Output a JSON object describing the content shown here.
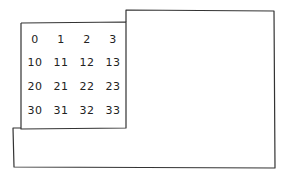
{
  "diagram": {
    "stroke_color": "#333333",
    "grid": {
      "rows": [
        [
          "0",
          "1",
          "2",
          "3"
        ],
        [
          "10",
          "11",
          "12",
          "13"
        ],
        [
          "20",
          "21",
          "22",
          "23"
        ],
        [
          "30",
          "31",
          "32",
          "33"
        ]
      ]
    }
  }
}
